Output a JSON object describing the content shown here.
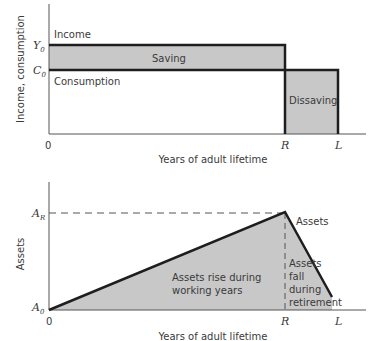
{
  "top_chart": {
    "y_axis_label": "Income, consumption",
    "x_axis_label": "Years of adult lifetime",
    "origin_label": "0",
    "y_ticks": [
      {
        "label": "Y",
        "sub": "0"
      },
      {
        "label": "C",
        "sub": "0"
      }
    ],
    "x_ticks": [
      "R",
      "L"
    ],
    "annotations": {
      "income": "Income",
      "saving": "Saving",
      "consumption": "Consumption",
      "dissaving": "Dissaving"
    }
  },
  "bottom_chart": {
    "y_axis_label": "Assets",
    "x_axis_label": "Years of adult lifetime",
    "origin_label": "0",
    "y_ticks": [
      {
        "label": "A",
        "sub": "R"
      },
      {
        "label": "A",
        "sub": "0"
      }
    ],
    "x_ticks": [
      "R",
      "L"
    ],
    "annotations": {
      "assets": "Assets",
      "rise_line1": "Assets rise during",
      "rise_line2": "working years",
      "fall_line1": "Assets",
      "fall_line2": "fall",
      "fall_line3": "during",
      "fall_line4": "retirement"
    }
  },
  "colors": {
    "shade": "#c8c8c8",
    "line": "#1e1e1e",
    "axis": "#555555"
  }
}
